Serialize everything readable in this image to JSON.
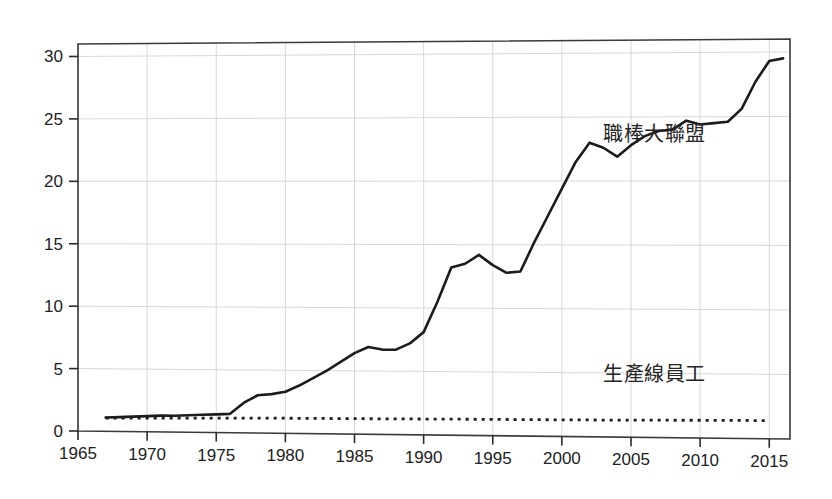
{
  "chart_data": {
    "type": "line",
    "title": "",
    "subtitle": "",
    "xlabel": "",
    "ylabel": "",
    "xlim": [
      1965,
      2016.5
    ],
    "ylim": [
      0,
      31
    ],
    "grid": true,
    "legend_position": "inline-annotation",
    "x_ticks": [
      1965,
      1970,
      1975,
      1980,
      1985,
      1990,
      1995,
      2000,
      2005,
      2010,
      2015
    ],
    "x_tick_labels": [
      "1965",
      "1970",
      "1975",
      "1980",
      "1985",
      "1990",
      "1995",
      "2000",
      "2005",
      "2010",
      "2015"
    ],
    "y_ticks": [
      0,
      5,
      10,
      15,
      20,
      25,
      30
    ],
    "y_tick_labels": [
      "0",
      "5",
      "10",
      "15",
      "20",
      "25",
      "30"
    ],
    "series": [
      {
        "name": "職棒大聯盟",
        "style": "solid",
        "color": "#1c1c1c",
        "label_x": 2003,
        "label_y": 23.1,
        "x": [
          1967,
          1968,
          1969,
          1970,
          1971,
          1972,
          1973,
          1974,
          1975,
          1976,
          1977,
          1978,
          1979,
          1980,
          1981,
          1982,
          1983,
          1984,
          1985,
          1986,
          1987,
          1988,
          1989,
          1990,
          1991,
          1992,
          1993,
          1994,
          1995,
          1996,
          1997,
          1998,
          1999,
          2000,
          2001,
          2002,
          2003,
          2004,
          2005,
          2006,
          2007,
          2008,
          2009,
          2010,
          2011,
          2012,
          2013,
          2014,
          2015,
          2016
        ],
        "y": [
          1.1,
          1.15,
          1.2,
          1.25,
          1.3,
          1.3,
          1.35,
          1.4,
          1.45,
          1.5,
          2.4,
          3.0,
          3.1,
          3.3,
          3.8,
          4.4,
          5.0,
          5.7,
          6.4,
          6.9,
          6.7,
          6.7,
          7.2,
          8.1,
          10.5,
          13.2,
          13.5,
          14.2,
          13.4,
          12.8,
          12.9,
          15.2,
          17.3,
          19.4,
          21.5,
          23.0,
          22.6,
          21.9,
          22.8,
          23.5,
          23.9,
          24.0,
          24.7,
          24.4,
          24.5,
          24.6,
          25.6,
          27.7,
          29.3,
          29.5
        ]
      },
      {
        "name": "生產線員工",
        "style": "dotted",
        "color": "#1c1c1c",
        "label_x": 2003,
        "label_y": 4.4,
        "x": [
          1967,
          1970,
          1975,
          1980,
          1985,
          1990,
          1995,
          2000,
          2005,
          2010,
          2013,
          2015
        ],
        "y": [
          1.05,
          1.1,
          1.15,
          1.2,
          1.22,
          1.25,
          1.28,
          1.3,
          1.33,
          1.38,
          1.4,
          1.4
        ]
      }
    ]
  },
  "figure": {
    "background_color": "#ffffff",
    "frame_color": "#3a3a3a",
    "grid_color": "#d8d8d8"
  }
}
